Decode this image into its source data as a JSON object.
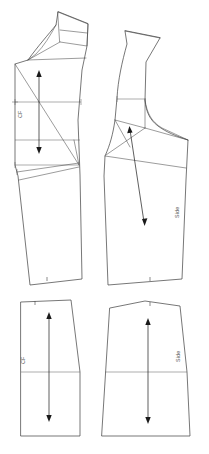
{
  "document": {
    "title": "Sewing Pattern Draft",
    "background_color": "#ffffff",
    "line_color": "#3c3c3c",
    "label_color": "#555555",
    "width": 209,
    "height": 454
  },
  "pieces": [
    {
      "id": "bodice-front-cf",
      "name": "Bodice Front Center Front",
      "label": "CF",
      "position": "top-left",
      "grainline": "vertical-double-arrow",
      "notches": 2
    },
    {
      "id": "bodice-side",
      "name": "Bodice Side Panel",
      "label": "Side",
      "position": "top-right",
      "grainline": "angled-double-arrow",
      "notches": 2
    },
    {
      "id": "skirt-front-cf",
      "name": "Skirt Front Center Front",
      "label": "CF",
      "position": "bottom-left",
      "grainline": "vertical-double-arrow",
      "notches": 1
    },
    {
      "id": "skirt-side",
      "name": "Skirt Side Panel",
      "label": "Side",
      "position": "bottom-right",
      "grainline": "vertical-double-arrow",
      "notches": 1
    }
  ],
  "labels": {
    "cf_top": "CF",
    "side_top": "Side",
    "cf_bottom": "CF",
    "side_bottom": "Side"
  }
}
